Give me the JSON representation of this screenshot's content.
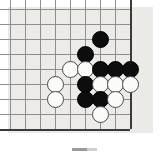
{
  "figure": {
    "kind": "go-board-corner-diagram",
    "title": "",
    "board": {
      "background_color": "#edebe7",
      "paper_color": "#eceae6",
      "grid_color": "#8e8e90",
      "edge_color": "#3a3a3c",
      "cell_size": 15,
      "origin_x": 10,
      "origin_y": 9,
      "columns": 9,
      "rows": 8,
      "right_edge_column": 8,
      "bottom_edge_row": 8
    },
    "stones": [
      {
        "color": "black",
        "col": 6,
        "row": 2
      },
      {
        "color": "black",
        "col": 5,
        "row": 3
      },
      {
        "color": "white",
        "col": 4,
        "row": 4
      },
      {
        "color": "white",
        "col": 5,
        "row": 4
      },
      {
        "color": "black",
        "col": 6,
        "row": 4
      },
      {
        "color": "black",
        "col": 7,
        "row": 4
      },
      {
        "color": "black",
        "col": 8,
        "row": 4
      },
      {
        "color": "white",
        "col": 3,
        "row": 5
      },
      {
        "color": "black",
        "col": 5,
        "row": 5
      },
      {
        "color": "white",
        "col": 6,
        "row": 5
      },
      {
        "color": "white",
        "col": 7,
        "row": 5
      },
      {
        "color": "white",
        "col": 8,
        "row": 5
      },
      {
        "color": "white",
        "col": 3,
        "row": 6
      },
      {
        "color": "black",
        "col": 5,
        "row": 6
      },
      {
        "color": "black",
        "col": 6,
        "row": 6
      },
      {
        "color": "white",
        "col": 7,
        "row": 6
      },
      {
        "color": "white",
        "col": 6,
        "row": 7
      }
    ],
    "stone_colors": {
      "black_fill": "#0d0d0d",
      "white_fill": "#fbfbfa",
      "white_outline": "#4a4a4c"
    },
    "caption": {
      "text": "",
      "mark_color": "#9a9a9a"
    }
  }
}
